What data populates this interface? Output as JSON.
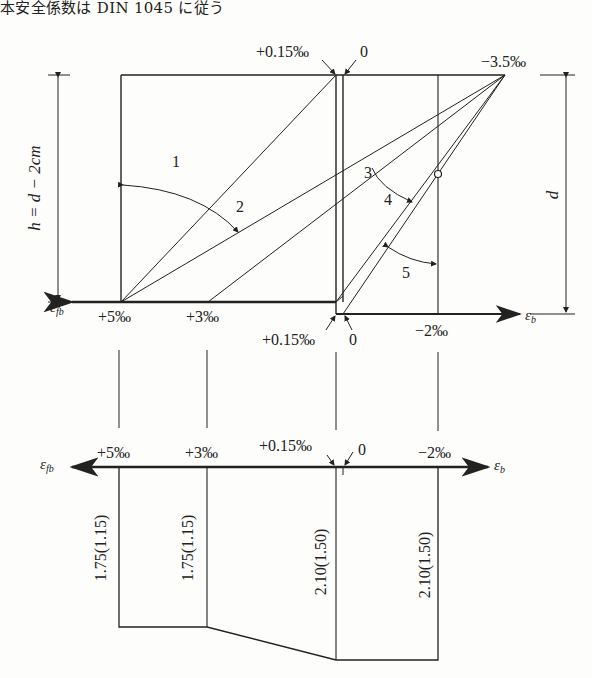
{
  "header": {
    "caption": "本安全係数は DIN 1045 に従う"
  },
  "upper_diagram": {
    "top_labels": {
      "plus_015": "+0.15‰",
      "zero": "0",
      "minus_35": "−3.5‰"
    },
    "bottom_labels": {
      "plus_5": "+5‰",
      "plus_3": "+3‰",
      "plus_015": "+0.15‰",
      "zero": "0",
      "minus_2": "−2‰"
    },
    "axis_left_label": "ε",
    "axis_left_sub": "fb",
    "axis_right_label": "ε",
    "axis_right_sub": "b",
    "left_dimension": "h = d − 2cm",
    "right_dimension": "d",
    "region_labels": [
      "1",
      "2",
      "3",
      "4",
      "5"
    ]
  },
  "lower_diagram": {
    "axis_labels": {
      "plus_5": "+5‰",
      "plus_3": "+3‰",
      "plus_015": "+0.15‰",
      "zero": "0",
      "minus_2": "−2‰"
    },
    "axis_left_label": "ε",
    "axis_left_sub": "fb",
    "axis_right_label": "ε",
    "axis_right_sub": "b",
    "safety_factors": [
      {
        "strain": "+5‰",
        "value": "1.75(1.15)"
      },
      {
        "strain": "+3‰",
        "value": "1.75(1.15)"
      },
      {
        "strain": "+0.15‰",
        "value": "2.10(1.50)"
      },
      {
        "strain": "−2‰",
        "value": "2.10(1.50)"
      }
    ]
  },
  "colors": {
    "ink": "#222222",
    "paper": "#fdfdfb"
  }
}
